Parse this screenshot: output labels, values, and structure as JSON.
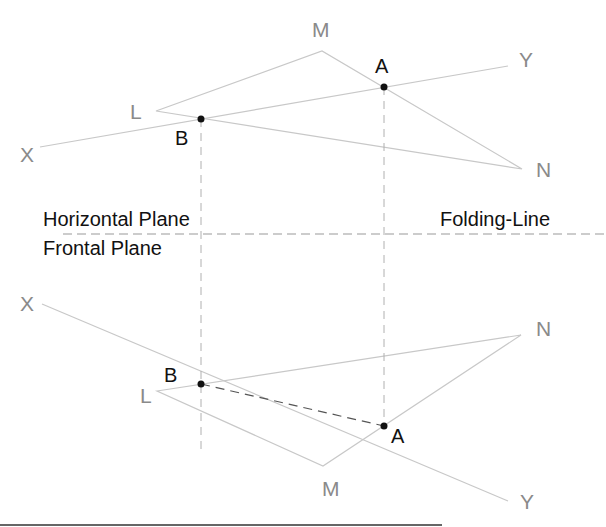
{
  "diagram": {
    "labels": {
      "fold_top": "Horizontal Plane",
      "fold_bottom": "Frontal Plane",
      "fold_line": "Folding-Line"
    },
    "top_view": {
      "X": "X",
      "Y": "Y",
      "L": "L",
      "M": "M",
      "N": "N",
      "A": "A",
      "B": "B"
    },
    "front_view": {
      "X": "X",
      "Y": "Y",
      "L": "L",
      "M": "M",
      "N": "N",
      "A": "A",
      "B": "B"
    },
    "colors": {
      "construction": "#c8c8c8",
      "projector": "#b0b0b0",
      "label_grey": "#8a8a8a",
      "point": "#111111",
      "fold_line": "#9a9a9a",
      "hidden_segment": "#555555"
    }
  }
}
